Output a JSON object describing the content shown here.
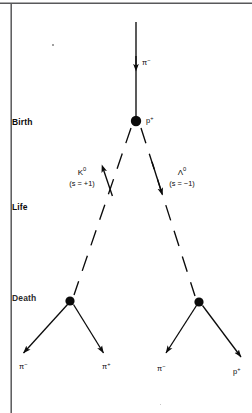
{
  "figure": {
    "background_color": "#ffffff",
    "ink_color": "#0b0b0b",
    "width": 252,
    "height": 413
  },
  "stages": [
    {
      "id": "birth",
      "label": "Birth",
      "x": 12,
      "y": 117
    },
    {
      "id": "life",
      "label": "Life",
      "x": 12,
      "y": 202
    },
    {
      "id": "death",
      "label": "Death",
      "x": 12,
      "y": 293
    }
  ],
  "vertices": [
    {
      "id": "production-vertex",
      "x": 136,
      "y": 121,
      "r": 5.2,
      "label": "p",
      "charge": "+"
    },
    {
      "id": "left-decay-vertex",
      "x": 70,
      "y": 301,
      "r": 4.6
    },
    {
      "id": "right-decay-vertex",
      "x": 199,
      "y": 302,
      "r": 4.6
    }
  ],
  "tracks": {
    "incoming": {
      "name": "incoming-pion",
      "symbol": "π",
      "charge": "−",
      "label_x": 142,
      "label_y": 63,
      "style": "solid",
      "x1": 136,
      "y1": 22,
      "x2": 136,
      "y2": 116,
      "arrow_at": 0.56
    },
    "neutral": [
      {
        "name": "kaon-track",
        "symbol": "K",
        "superscript": "0",
        "strangeness": "(s = +1)",
        "label_x": 68,
        "label_y": 176,
        "style": "dashed",
        "x1": 131,
        "y1": 128,
        "x2": 74,
        "y2": 295,
        "arrow_at": 0.36
      },
      {
        "name": "lambda-track",
        "symbol": "Λ",
        "superscript": "0",
        "strangeness": "(s = −1)",
        "label_x": 167,
        "label_y": 176,
        "style": "dashed",
        "x1": 141,
        "y1": 128,
        "x2": 195,
        "y2": 296,
        "arrow_at": 0.36
      }
    ],
    "decay_products": [
      {
        "name": "left-decay-pion-minus",
        "symbol": "π",
        "charge": "−",
        "label_x": 19,
        "label_y": 367,
        "style": "solid",
        "x1": 67,
        "y1": 305,
        "x2": 22,
        "y2": 355
      },
      {
        "name": "left-decay-pion-plus",
        "symbol": "π",
        "charge": "+",
        "label_x": 102,
        "label_y": 367,
        "style": "solid",
        "x1": 74,
        "y1": 305,
        "x2": 105,
        "y2": 355
      },
      {
        "name": "right-decay-pion-minus",
        "symbol": "π",
        "charge": "−",
        "label_x": 157,
        "label_y": 369,
        "style": "solid",
        "x1": 196,
        "y1": 306,
        "x2": 165,
        "y2": 355
      },
      {
        "name": "right-decay-proton",
        "symbol": "p",
        "charge": "+",
        "label_x": 233,
        "label_y": 372,
        "style": "solid",
        "x1": 203,
        "y1": 306,
        "x2": 243,
        "y2": 360
      }
    ]
  },
  "frame": {
    "top_rule": {
      "x1": 0,
      "y1": 3,
      "x2": 252,
      "y2": 3
    },
    "left_rule": {
      "x1": 11,
      "y1": 4,
      "x2": 11,
      "y2": 413
    }
  },
  "artifacts": [
    {
      "name": "scan-speck-upper-left",
      "x": 52,
      "y": 44,
      "size": 1.6
    },
    {
      "name": "scan-speck-lower-right",
      "x": 160,
      "y": 404,
      "size": 1.4
    }
  ]
}
